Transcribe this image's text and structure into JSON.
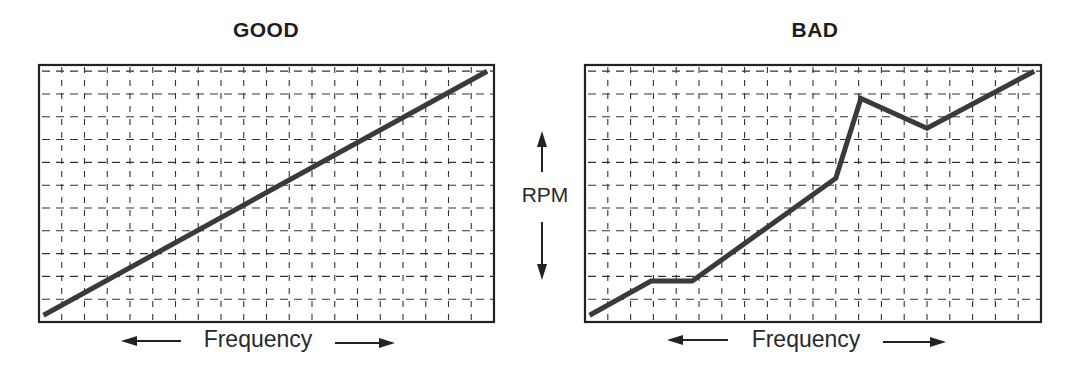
{
  "chart_data": [
    {
      "type": "line",
      "title": "GOOD",
      "xlabel": "Frequency",
      "ylabel": "RPM",
      "grid": true,
      "xlim": [
        0,
        20
      ],
      "ylim": [
        0,
        11.27
      ],
      "series": [
        {
          "name": "good-response",
          "x": [
            0.2,
            19.7
          ],
          "y": [
            0.3,
            11.0
          ]
        }
      ]
    },
    {
      "type": "line",
      "title": "BAD",
      "xlabel": "Frequency",
      "ylabel": "RPM",
      "grid": true,
      "xlim": [
        0,
        20
      ],
      "ylim": [
        0,
        11.27
      ],
      "series": [
        {
          "name": "bad-response",
          "x": [
            0.2,
            2.9,
            4.7,
            11.0,
            12.1,
            15.0,
            19.7
          ],
          "y": [
            0.3,
            1.8,
            1.8,
            6.3,
            9.8,
            8.5,
            11.0
          ]
        }
      ]
    }
  ],
  "panels": {
    "good": {
      "title": "GOOD",
      "xlabel": "Frequency"
    },
    "bad": {
      "title": "BAD",
      "xlabel": "Frequency"
    }
  },
  "shared_axis": {
    "ylabel": "RPM"
  },
  "colors": {
    "line": "#3a3a3a",
    "grid": "#333333",
    "frame": "#222222"
  }
}
